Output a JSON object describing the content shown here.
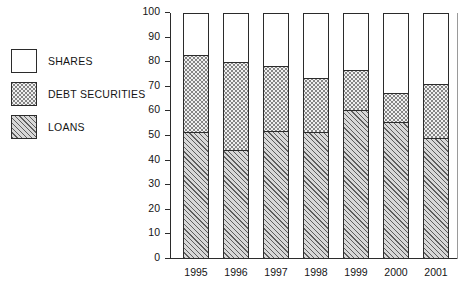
{
  "chart_data": {
    "type": "bar",
    "stacked": true,
    "title": "",
    "subtitle": "",
    "xlabel": "",
    "ylabel": "",
    "categories": [
      "1995",
      "1996",
      "1997",
      "1998",
      "1999",
      "2000",
      "2001"
    ],
    "series": [
      {
        "name": "LOANS",
        "values": [
          51.5,
          44.5,
          52.0,
          51.5,
          60.5,
          55.5,
          49.0
        ]
      },
      {
        "name": "DEBT SECURITIES",
        "values": [
          31.5,
          35.5,
          26.5,
          22.0,
          16.5,
          12.0,
          22.0
        ]
      },
      {
        "name": "SHARES",
        "values": [
          17.0,
          20.0,
          21.5,
          26.5,
          23.0,
          32.5,
          29.0
        ]
      }
    ],
    "cumulative_tops": [
      {
        "category": "1995",
        "loans": 51.5,
        "loans_plus_debt": 83.0,
        "total": 100
      },
      {
        "category": "1996",
        "loans": 44.5,
        "loans_plus_debt": 80.0,
        "total": 100
      },
      {
        "category": "1997",
        "loans": 52.0,
        "loans_plus_debt": 78.5,
        "total": 100
      },
      {
        "category": "1998",
        "loans": 51.5,
        "loans_plus_debt": 73.5,
        "total": 100
      },
      {
        "category": "1999",
        "loans": 60.5,
        "loans_plus_debt": 77.0,
        "total": 100
      },
      {
        "category": "2000",
        "loans": 55.5,
        "loans_plus_debt": 67.5,
        "total": 100
      },
      {
        "category": "2001",
        "loans": 49.0,
        "loans_plus_debt": 71.0,
        "total": 100
      }
    ],
    "ylim": [
      0,
      100
    ],
    "ytick_step": 10,
    "ytick_labels": [
      "0",
      "10",
      "20",
      "30",
      "40",
      "50",
      "60",
      "70",
      "80",
      "90",
      "100"
    ],
    "grid": false,
    "legend_position": "left-outside",
    "legend_order": [
      "SHARES",
      "DEBT SECURITIES",
      "LOANS"
    ]
  },
  "legend": {
    "items": [
      {
        "label": "SHARES",
        "pattern": "solid-white",
        "fill_class": "fill-shares"
      },
      {
        "label": "DEBT SECURITIES",
        "pattern": "fine-dotted-grey",
        "fill_class": "fill-debt"
      },
      {
        "label": "LOANS",
        "pattern": "diagonal-hatch",
        "fill_class": "fill-loans"
      }
    ]
  },
  "axis": {
    "y_tick_labels": [
      "100",
      "90",
      "80",
      "70",
      "60",
      "50",
      "40",
      "30",
      "20",
      "10",
      "0"
    ],
    "x_tick_labels": [
      "1995",
      "1996",
      "1997",
      "1998",
      "1999",
      "2000",
      "2001"
    ]
  },
  "colors": {
    "axis": "#2b2b2b",
    "text": "#141414",
    "background": "#ffffff",
    "pattern_line": "#5e5e5e",
    "pattern_dot": "#7d7d7d",
    "loans_base": "#d8d8d8",
    "debt_base": "#f0f0f0",
    "shares_base": "#ffffff"
  }
}
